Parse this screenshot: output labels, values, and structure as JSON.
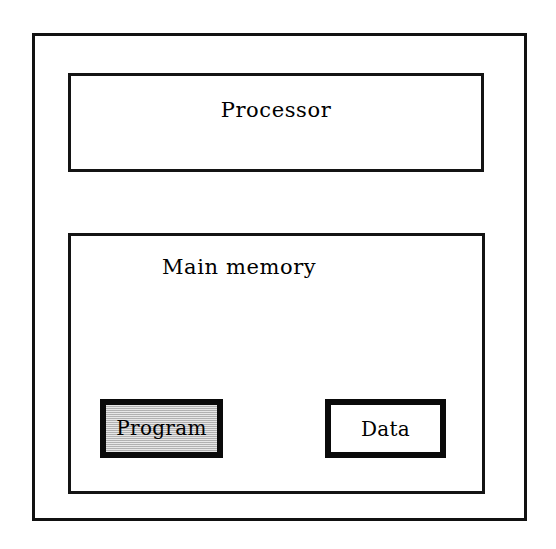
{
  "diagram": {
    "outer": {
      "name": "system-boundary",
      "label": ""
    },
    "blocks": [
      {
        "id": "processor",
        "label": "Processor",
        "fill": "#ffffff",
        "border": "#141414"
      },
      {
        "id": "main-memory",
        "label": "Main memory",
        "fill": "#ffffff",
        "border": "#141414"
      }
    ],
    "memory_regions": [
      {
        "id": "program",
        "label": "Program",
        "fill": "#c9c9c9",
        "border": "#0a0a0a",
        "shaded": "true"
      },
      {
        "id": "data",
        "label": "Data",
        "fill": "#ffffff",
        "border": "#0a0a0a",
        "shaded": "false"
      }
    ],
    "colors": {
      "background": "#ffffff",
      "ink": "#000000",
      "shaded_fill": "#c9c9c9"
    }
  }
}
